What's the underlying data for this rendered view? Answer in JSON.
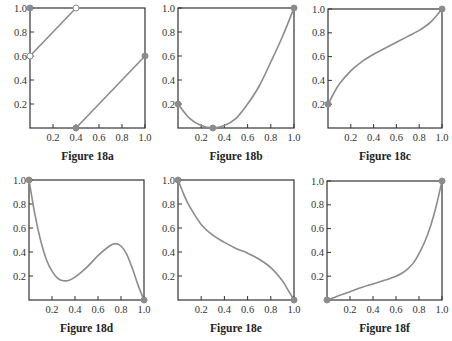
{
  "style": {
    "curve_color": "#8c8c8c",
    "axis_color": "#333333",
    "point_color": "#8c8c8c"
  },
  "chart_data": [
    {
      "id": "a",
      "type": "line",
      "title": "Figure 18a",
      "xlim": [
        0,
        1.0
      ],
      "ylim": [
        0,
        1.0
      ],
      "xticks": [
        "0.2",
        "0.4",
        "0.6",
        "0.8",
        "1.0"
      ],
      "yticks": [
        "0.2",
        "0.4",
        "0.6",
        "0.8",
        "1.0"
      ],
      "segments": [
        {
          "x": [
            0,
            0.4
          ],
          "y": [
            0.6,
            1.0
          ]
        },
        {
          "x": [
            0.4,
            1.0
          ],
          "y": [
            0,
            0.6
          ]
        }
      ],
      "points": [
        {
          "x": 0,
          "y": 1.0,
          "filled": true
        },
        {
          "x": 0,
          "y": 0.6,
          "filled": false
        },
        {
          "x": 0.4,
          "y": 1.0,
          "filled": false
        },
        {
          "x": 0.4,
          "y": 0,
          "filled": true
        },
        {
          "x": 1.0,
          "y": 0.6,
          "filled": true
        }
      ]
    },
    {
      "id": "b",
      "type": "line",
      "title": "Figure 18b",
      "xlim": [
        0,
        1.0
      ],
      "ylim": [
        0,
        1.0
      ],
      "xticks": [
        "0.2",
        "0.4",
        "0.6",
        "0.8",
        "1.0"
      ],
      "yticks": [
        "0.2",
        "0.4",
        "0.6",
        "0.8",
        "1.0"
      ],
      "segments": [
        {
          "x": [
            0,
            0.1,
            0.2,
            0.3,
            0.4,
            0.5,
            0.6,
            0.7,
            0.8,
            0.9,
            1.0
          ],
          "y": [
            0.2,
            0.08,
            0.02,
            0.0,
            0.02,
            0.08,
            0.2,
            0.35,
            0.55,
            0.76,
            1.0
          ]
        }
      ],
      "points": [
        {
          "x": 0,
          "y": 0.2,
          "filled": true
        },
        {
          "x": 0.3,
          "y": 0,
          "filled": true
        },
        {
          "x": 1.0,
          "y": 1.0,
          "filled": true
        }
      ]
    },
    {
      "id": "c",
      "type": "line",
      "title": "Figure 18c",
      "xlim": [
        0,
        1.0
      ],
      "ylim": [
        0,
        1.0
      ],
      "xticks": [
        "0.2",
        "0.4",
        "0.6",
        "0.8",
        "1.0"
      ],
      "yticks": [
        "0.2",
        "0.4",
        "0.6",
        "0.8",
        "1.0"
      ],
      "segments": [
        {
          "x": [
            0,
            0.05,
            0.1,
            0.2,
            0.3,
            0.4,
            0.5,
            0.6,
            0.7,
            0.8,
            0.9,
            1.0
          ],
          "y": [
            0.2,
            0.29,
            0.37,
            0.48,
            0.56,
            0.62,
            0.67,
            0.72,
            0.77,
            0.82,
            0.89,
            1.0
          ]
        }
      ],
      "points": [
        {
          "x": 0,
          "y": 0.2,
          "filled": true
        },
        {
          "x": 1.0,
          "y": 1.0,
          "filled": true
        }
      ]
    },
    {
      "id": "d",
      "type": "line",
      "title": "Figure 18d",
      "xlim": [
        0,
        1.0
      ],
      "ylim": [
        0,
        1.0
      ],
      "xticks": [
        "0.2",
        "0.4",
        "0.6",
        "0.8",
        "1.0"
      ],
      "yticks": [
        "0.2",
        "0.4",
        "0.6",
        "0.8",
        "1.0"
      ],
      "segments": [
        {
          "x": [
            0,
            0.05,
            0.1,
            0.15,
            0.2,
            0.25,
            0.3,
            0.35,
            0.4,
            0.5,
            0.6,
            0.7,
            0.75,
            0.8,
            0.85,
            0.9,
            0.95,
            1.0
          ],
          "y": [
            1.0,
            0.72,
            0.5,
            0.34,
            0.24,
            0.18,
            0.16,
            0.165,
            0.19,
            0.27,
            0.37,
            0.45,
            0.47,
            0.45,
            0.38,
            0.26,
            0.12,
            0.0
          ]
        }
      ],
      "points": [
        {
          "x": 0,
          "y": 1.0,
          "filled": true
        },
        {
          "x": 1.0,
          "y": 0,
          "filled": true
        }
      ]
    },
    {
      "id": "e",
      "type": "line",
      "title": "Figure 18e",
      "xlim": [
        0,
        1.0
      ],
      "ylim": [
        0,
        1.0
      ],
      "xticks": [
        "0.2",
        "0.4",
        "0.6",
        "0.8",
        "1.0"
      ],
      "yticks": [
        "0.2",
        "0.4",
        "0.6",
        "0.8",
        "1.0"
      ],
      "segments": [
        {
          "x": [
            0,
            0.05,
            0.1,
            0.2,
            0.3,
            0.4,
            0.5,
            0.6,
            0.7,
            0.8,
            0.9,
            0.95,
            1.0
          ],
          "y": [
            1.0,
            0.88,
            0.78,
            0.63,
            0.54,
            0.48,
            0.43,
            0.39,
            0.34,
            0.27,
            0.16,
            0.08,
            0.0
          ]
        }
      ],
      "points": [
        {
          "x": 0,
          "y": 1.0,
          "filled": true
        },
        {
          "x": 1.0,
          "y": 0,
          "filled": true
        }
      ]
    },
    {
      "id": "f",
      "type": "line",
      "title": "Figure 18f",
      "xlim": [
        0,
        1.0
      ],
      "ylim": [
        0,
        1.0
      ],
      "xticks": [
        "0.2",
        "0.4",
        "0.6",
        "0.8",
        "1.0"
      ],
      "yticks": [
        "0.2",
        "0.4",
        "0.6",
        "0.8",
        "1.0"
      ],
      "segments": [
        {
          "x": [
            0,
            0.1,
            0.2,
            0.3,
            0.4,
            0.5,
            0.6,
            0.65,
            0.7,
            0.75,
            0.8,
            0.85,
            0.9,
            0.95,
            1.0
          ],
          "y": [
            0.0,
            0.035,
            0.07,
            0.105,
            0.135,
            0.165,
            0.2,
            0.225,
            0.26,
            0.31,
            0.39,
            0.49,
            0.62,
            0.79,
            1.0
          ]
        }
      ],
      "points": [
        {
          "x": 0,
          "y": 0,
          "filled": true
        },
        {
          "x": 1.0,
          "y": 1.0,
          "filled": true
        }
      ]
    }
  ],
  "layout": [
    {
      "left": 30,
      "top": 8,
      "w": 115,
      "h": 120
    },
    {
      "left": 178,
      "top": 8,
      "w": 116,
      "h": 120
    },
    {
      "left": 328,
      "top": 9,
      "w": 114,
      "h": 119
    },
    {
      "left": 29,
      "top": 180,
      "w": 115,
      "h": 120
    },
    {
      "left": 178,
      "top": 180,
      "w": 116,
      "h": 120
    },
    {
      "left": 327,
      "top": 181,
      "w": 115,
      "h": 119
    }
  ]
}
